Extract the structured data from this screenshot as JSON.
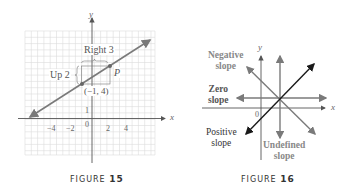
{
  "figures": [
    {
      "caption_word": "FIGURE",
      "caption_num": "15",
      "axes": {
        "x_label": "x",
        "y_label": "y",
        "origin_label": "0"
      },
      "x_ticks": [
        "−4",
        "−2",
        "2",
        "4"
      ],
      "y_ticks": [
        "1"
      ],
      "point_label": "(−1, 4)",
      "p_label": "P",
      "run_label": "Right 3",
      "rise_label": "Up 2"
    },
    {
      "caption_word": "FIGURE",
      "caption_num": "16",
      "axes": {
        "x_label": "x",
        "y_label": "y",
        "origin_label": "0"
      },
      "labels": {
        "negative_1": "Negative",
        "negative_2": "slope",
        "zero_1": "Zero",
        "zero_2": "slope",
        "positive_1": "Positive",
        "positive_2": "slope",
        "undefined_1": "Undefined",
        "undefined_2": "slope"
      }
    }
  ],
  "colors": {
    "grid": "#d9d9d9",
    "line": "#7a7a7a",
    "axis": "#555555",
    "dark_line": "#1a1a1a",
    "label": "#666666"
  }
}
